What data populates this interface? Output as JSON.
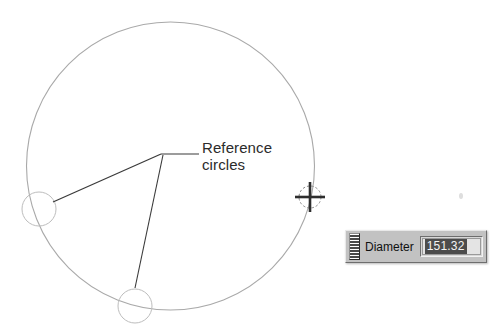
{
  "canvas": {
    "background_color": "#ffffff",
    "width": 504,
    "height": 333
  },
  "drawing": {
    "main_circle": {
      "name": "main-circle",
      "cx": 170.5,
      "cy": 166,
      "r": 144,
      "stroke_color": "#a9a9a9",
      "stroke_width": 1.1
    },
    "reference_circles": [
      {
        "name": "reference-circle-left",
        "cx": 39,
        "cy": 209,
        "r": 17,
        "stroke_color": "#bdbdbd",
        "stroke_width": 1
      },
      {
        "name": "reference-circle-bottom",
        "cx": 135,
        "cy": 306,
        "r": 17,
        "stroke_color": "#bdbdbd",
        "stroke_width": 1
      }
    ],
    "leader_lines": {
      "stroke_color": "#3a3a3a",
      "stroke_width": 1.1,
      "apex": {
        "x": 161,
        "y": 154
      },
      "segments": [
        {
          "name": "leader-to-left-circle",
          "x1": 161,
          "y1": 154,
          "x2": 53,
          "y2": 202
        },
        {
          "name": "leader-to-bottom-circle",
          "x1": 163,
          "y1": 155,
          "x2": 135,
          "y2": 288
        },
        {
          "name": "leader-to-text",
          "x1": 161,
          "y1": 154,
          "x2": 199,
          "y2": 154
        }
      ]
    },
    "crosshair_cursor": {
      "name": "crosshair-cursor",
      "cx": 310,
      "cy": 197,
      "arm_length": 15,
      "circle_r": 11,
      "stroke_color": "#2e2e2e",
      "circle_stroke_color": "#8a8a8a"
    }
  },
  "annotation": {
    "label_line1": "Reference",
    "label_line2": "circles"
  },
  "toolbar": {
    "title": "Diameter",
    "label": "Diameter",
    "value": "151.32",
    "value_selected": true,
    "grip_name": "toolbar-drag-grip",
    "background_color": "#c2c2c2",
    "selection_color": "#4c4c4c",
    "selection_text_color": "#f4f4f4"
  }
}
